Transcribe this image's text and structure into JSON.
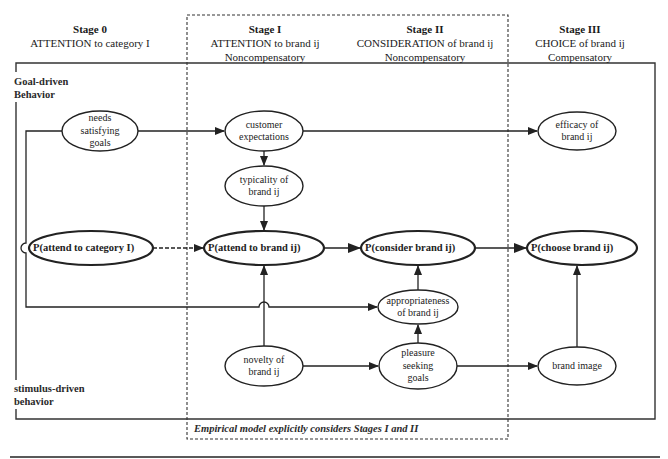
{
  "headers": [
    {
      "title": "Stage 0",
      "line1": "ATTENTION to category I",
      "line2": ""
    },
    {
      "title": "Stage I",
      "line1": "ATTENTION to brand ij",
      "line2": "Noncompensatory"
    },
    {
      "title": "Stage II",
      "line1": "CONSIDERATION of brand ij",
      "line2": "Noncompensatory"
    },
    {
      "title": "Stage III",
      "line1": "CHOICE of brand ij",
      "line2": "Compensatory"
    }
  ],
  "side_labels": {
    "goal_driven": "Goal-driven\nBehavior",
    "stimulus_driven": "stimulus-driven\nbehavior"
  },
  "note": "Empirical model explicitly considers Stages I and II",
  "nodes": {
    "needs_goals": "needs\nsatisfying\ngoals",
    "customer_expectations": "customer\nexpectations",
    "efficacy": "efficacy of\nbrand ij",
    "typicality": "typicality of\nbrand ij",
    "p_attend_category": "P(attend to category I)",
    "p_attend_brand": "P(attend to brand ij)",
    "p_consider_brand": "P(consider brand ij)",
    "p_choose_brand": "P(choose brand ij)",
    "appropriateness": "appropriateness\nof brand ij",
    "novelty": "novelty of\nbrand ij",
    "pleasure_goals": "pleasure\nseeking\ngoals",
    "brand_image": "brand image"
  },
  "colors": {
    "stroke": "#222222",
    "background": "#ffffff"
  }
}
